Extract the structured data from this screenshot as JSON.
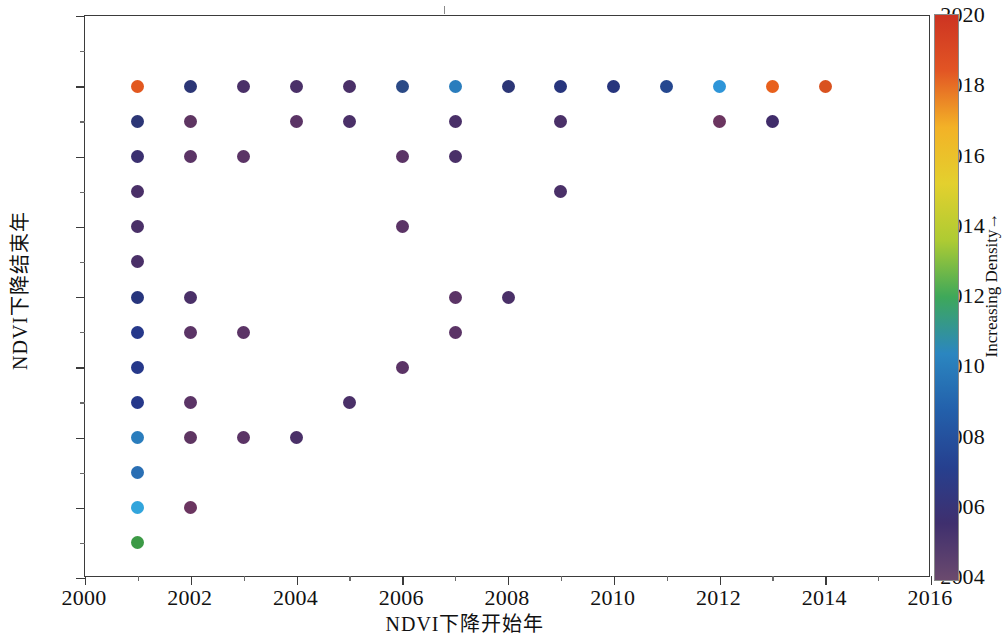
{
  "chart_data": {
    "type": "scatter",
    "title": "",
    "xlabel": "NDVI下降开始年",
    "ylabel": "NDVI下降结束年",
    "xlim": [
      2000,
      2016
    ],
    "ylim": [
      2004,
      2020
    ],
    "xticks": [
      2000,
      2002,
      2004,
      2006,
      2008,
      2010,
      2012,
      2014,
      2016
    ],
    "yticks": [
      2004,
      2006,
      2008,
      2010,
      2012,
      2014,
      2016,
      2018,
      2020
    ],
    "xtick_labels": [
      "2000",
      "2002",
      "2004",
      "2006",
      "2008",
      "2010",
      "2012",
      "2014",
      "2016"
    ],
    "ytick_labels": [
      "2004",
      "2006",
      "2008",
      "2010",
      "2012",
      "2014",
      "2016",
      "2018",
      "2020"
    ],
    "grid": false,
    "legend": "none",
    "colorbar": {
      "label": "Increasing Density→",
      "position": "right",
      "orientation": "vertical",
      "ticks": [],
      "colormap": "turbo",
      "stops": [
        "#6b4a6e",
        "#3f2f6e",
        "#26408f",
        "#2360ab",
        "#2b86c0",
        "#3ea85a",
        "#aecb33",
        "#e3d02e",
        "#f3b227",
        "#e25524",
        "#cc3322"
      ]
    },
    "marker": {
      "shape": "circle",
      "size_px": 13
    },
    "points": [
      {
        "x": 2001,
        "y": 2018,
        "color": "#e2581f"
      },
      {
        "x": 2001,
        "y": 2017,
        "color": "#2c3676"
      },
      {
        "x": 2001,
        "y": 2016,
        "color": "#3b3070"
      },
      {
        "x": 2001,
        "y": 2015,
        "color": "#4a3068"
      },
      {
        "x": 2001,
        "y": 2014,
        "color": "#4a3068"
      },
      {
        "x": 2001,
        "y": 2013,
        "color": "#4a3068"
      },
      {
        "x": 2001,
        "y": 2012,
        "color": "#27357d"
      },
      {
        "x": 2001,
        "y": 2011,
        "color": "#26388a"
      },
      {
        "x": 2001,
        "y": 2010,
        "color": "#26388a"
      },
      {
        "x": 2001,
        "y": 2009,
        "color": "#26388a"
      },
      {
        "x": 2001,
        "y": 2008,
        "color": "#2a7dbd"
      },
      {
        "x": 2001,
        "y": 2007,
        "color": "#2a6fb4"
      },
      {
        "x": 2001,
        "y": 2006,
        "color": "#32a5dc"
      },
      {
        "x": 2001,
        "y": 2005,
        "color": "#3c9a46"
      },
      {
        "x": 2002,
        "y": 2018,
        "color": "#2c3676"
      },
      {
        "x": 2002,
        "y": 2017,
        "color": "#5e3562"
      },
      {
        "x": 2002,
        "y": 2016,
        "color": "#5b3466"
      },
      {
        "x": 2002,
        "y": 2012,
        "color": "#4a3068"
      },
      {
        "x": 2002,
        "y": 2011,
        "color": "#5b3466"
      },
      {
        "x": 2002,
        "y": 2009,
        "color": "#5b3466"
      },
      {
        "x": 2002,
        "y": 2008,
        "color": "#5e3562"
      },
      {
        "x": 2002,
        "y": 2006,
        "color": "#6b3560"
      },
      {
        "x": 2003,
        "y": 2018,
        "color": "#4a3068"
      },
      {
        "x": 2003,
        "y": 2016,
        "color": "#5b3466"
      },
      {
        "x": 2003,
        "y": 2011,
        "color": "#5b3466"
      },
      {
        "x": 2003,
        "y": 2008,
        "color": "#5b3466"
      },
      {
        "x": 2004,
        "y": 2018,
        "color": "#4a3068"
      },
      {
        "x": 2004,
        "y": 2017,
        "color": "#5b3466"
      },
      {
        "x": 2004,
        "y": 2008,
        "color": "#4a3068"
      },
      {
        "x": 2005,
        "y": 2018,
        "color": "#4a3068"
      },
      {
        "x": 2005,
        "y": 2017,
        "color": "#4a3068"
      },
      {
        "x": 2005,
        "y": 2009,
        "color": "#4a3068"
      },
      {
        "x": 2006,
        "y": 2018,
        "color": "#2b4a86"
      },
      {
        "x": 2006,
        "y": 2016,
        "color": "#5b3466"
      },
      {
        "x": 2006,
        "y": 2014,
        "color": "#5b3466"
      },
      {
        "x": 2006,
        "y": 2010,
        "color": "#5b3466"
      },
      {
        "x": 2007,
        "y": 2018,
        "color": "#2a7dbd"
      },
      {
        "x": 2007,
        "y": 2017,
        "color": "#4a3068"
      },
      {
        "x": 2007,
        "y": 2016,
        "color": "#4a3068"
      },
      {
        "x": 2007,
        "y": 2012,
        "color": "#5b3466"
      },
      {
        "x": 2007,
        "y": 2011,
        "color": "#5b3466"
      },
      {
        "x": 2008,
        "y": 2018,
        "color": "#2c3676"
      },
      {
        "x": 2008,
        "y": 2012,
        "color": "#4a3068"
      },
      {
        "x": 2009,
        "y": 2018,
        "color": "#27357d"
      },
      {
        "x": 2009,
        "y": 2017,
        "color": "#4a3068"
      },
      {
        "x": 2009,
        "y": 2015,
        "color": "#4a3068"
      },
      {
        "x": 2010,
        "y": 2018,
        "color": "#27357d"
      },
      {
        "x": 2011,
        "y": 2018,
        "color": "#25478f"
      },
      {
        "x": 2012,
        "y": 2018,
        "color": "#2e95d8"
      },
      {
        "x": 2012,
        "y": 2017,
        "color": "#6b3560"
      },
      {
        "x": 2013,
        "y": 2018,
        "color": "#e8601c"
      },
      {
        "x": 2013,
        "y": 2017,
        "color": "#402c6a"
      },
      {
        "x": 2014,
        "y": 2018,
        "color": "#d9521f"
      }
    ]
  },
  "axes": {
    "x_title": "NDVI下降开始年",
    "y_title": "NDVI下降结束年"
  },
  "colorbar_title": "Increasing Density→"
}
